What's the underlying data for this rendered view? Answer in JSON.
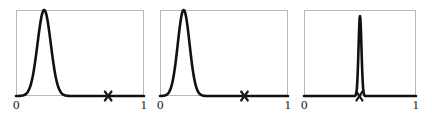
{
  "figure": {
    "background_color": "#ffffff",
    "frame_color": "#b9b9b9",
    "curve_color": "#111111",
    "marker_color": "#1a1a1a",
    "panel_count": 3
  },
  "chart_data": [
    {
      "type": "line",
      "title": "",
      "xlabel": "",
      "ylabel": "",
      "xlim": [
        0,
        1
      ],
      "ylim": [
        0,
        1
      ],
      "grid": false,
      "legend": null,
      "xticks": [
        0,
        1
      ],
      "xticklabels": [
        "0",
        "1"
      ],
      "series": [
        {
          "name": "posterior density",
          "peak_x": 0.22,
          "peak_y": 1.0,
          "width": 0.052,
          "x": [
            0.0,
            0.02,
            0.04,
            0.06,
            0.08,
            0.1,
            0.12,
            0.14,
            0.16,
            0.18,
            0.2,
            0.22,
            0.24,
            0.26,
            0.28,
            0.3,
            0.32,
            0.34,
            0.36,
            0.38,
            0.4,
            0.45,
            0.5,
            0.6,
            0.7,
            0.8,
            0.9,
            1.0
          ],
          "values": [
            0.0,
            0.001,
            0.004,
            0.015,
            0.05,
            0.135,
            0.3,
            0.54,
            0.79,
            0.95,
            0.998,
            1.0,
            0.95,
            0.8,
            0.58,
            0.36,
            0.19,
            0.09,
            0.038,
            0.015,
            0.006,
            0.001,
            0.0,
            0.0,
            0.0,
            0.0,
            0.0,
            0.0
          ]
        }
      ],
      "annotations": [
        {
          "type": "x-marker",
          "label": "×",
          "x": 0.72,
          "y": 0.0
        }
      ]
    },
    {
      "type": "line",
      "title": "",
      "xlabel": "",
      "ylabel": "",
      "xlim": [
        0,
        1
      ],
      "ylim": [
        0,
        1
      ],
      "grid": false,
      "legend": null,
      "xticks": [
        0,
        1
      ],
      "xticklabels": [
        "0",
        "1"
      ],
      "series": [
        {
          "name": "posterior density",
          "peak_x": 0.185,
          "peak_y": 1.0,
          "width": 0.046,
          "x": [
            0.0,
            0.02,
            0.04,
            0.06,
            0.08,
            0.1,
            0.12,
            0.14,
            0.16,
            0.18,
            0.2,
            0.22,
            0.24,
            0.26,
            0.28,
            0.3,
            0.32,
            0.34,
            0.36,
            0.4,
            0.45,
            0.5,
            0.6,
            0.7,
            0.8,
            0.9,
            1.0
          ],
          "values": [
            0.0,
            0.002,
            0.008,
            0.03,
            0.09,
            0.22,
            0.44,
            0.7,
            0.92,
            1.0,
            0.975,
            0.86,
            0.66,
            0.44,
            0.25,
            0.125,
            0.055,
            0.022,
            0.008,
            0.001,
            0.0,
            0.0,
            0.0,
            0.0,
            0.0,
            0.0,
            0.0
          ]
        }
      ],
      "annotations": [
        {
          "type": "x-marker",
          "label": "×",
          "x": 0.66,
          "y": 0.0
        }
      ]
    },
    {
      "type": "line",
      "title": "",
      "xlabel": "",
      "ylabel": "",
      "xlim": [
        0,
        1
      ],
      "ylim": [
        0,
        1
      ],
      "grid": false,
      "legend": null,
      "xticks": [
        0,
        1
      ],
      "xticklabels": [
        "0",
        "1"
      ],
      "series": [
        {
          "name": "posterior density",
          "peak_x": 0.5,
          "peak_y": 0.93,
          "width": 0.013,
          "x": [
            0.0,
            0.1,
            0.2,
            0.3,
            0.38,
            0.42,
            0.44,
            0.46,
            0.47,
            0.48,
            0.49,
            0.5,
            0.51,
            0.52,
            0.53,
            0.54,
            0.56,
            0.58,
            0.62,
            0.7,
            0.8,
            0.9,
            1.0
          ],
          "values": [
            0.0,
            0.0,
            0.0,
            0.0,
            0.001,
            0.01,
            0.04,
            0.2,
            0.43,
            0.72,
            0.9,
            0.93,
            0.88,
            0.68,
            0.4,
            0.18,
            0.03,
            0.005,
            0.001,
            0.0,
            0.0,
            0.0,
            0.0
          ]
        }
      ],
      "annotations": [
        {
          "type": "x-marker",
          "label": "×",
          "x": 0.495,
          "y": 0.0
        }
      ]
    }
  ],
  "panels": [
    {
      "id": "panel-1",
      "left_px": 16,
      "width_px": 128,
      "axis": {
        "min_label": "0",
        "max_label": "1"
      }
    },
    {
      "id": "panel-2",
      "left_px": 160,
      "width_px": 128,
      "axis": {
        "min_label": "0",
        "max_label": "1"
      }
    },
    {
      "id": "panel-3",
      "left_px": 304,
      "width_px": 112,
      "axis": {
        "min_label": "0",
        "max_label": "1"
      }
    }
  ]
}
